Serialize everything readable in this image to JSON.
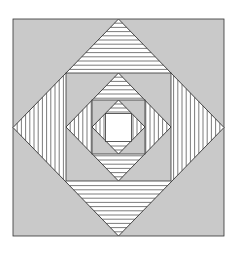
{
  "figure": {
    "type": "nested-squares-diamonds-pattern",
    "colors": {
      "background": "#ffffff",
      "square_fill": "#c9c9c9",
      "diamond_fill": "#ffffff",
      "stroke": "#333333",
      "stripe": "#444444"
    },
    "center": [
      118.5,
      127.5
    ],
    "levels": [
      {
        "name": "level-1",
        "square": {
          "x0": 13,
          "y0": 19,
          "x1": 224,
          "y1": 236
        },
        "stripe_spacing": 4.2
      },
      {
        "name": "level-2",
        "square": {
          "x0": 66,
          "y0": 73,
          "x1": 171,
          "y1": 181
        },
        "stripe_spacing": 4.2
      },
      {
        "name": "level-3",
        "square": {
          "x0": 92,
          "y0": 100,
          "x1": 145,
          "y1": 154
        },
        "stripe_spacing": 4.0
      }
    ],
    "innermost_square": {
      "x0": 105.5,
      "y0": 113.5,
      "x1": 131.5,
      "y1": 141.5,
      "fill": "#ffffff"
    },
    "stripe_orientation": {
      "top_triangle": "horizontal",
      "bottom_triangle": "horizontal",
      "left_triangle": "vertical",
      "right_triangle": "vertical"
    }
  }
}
